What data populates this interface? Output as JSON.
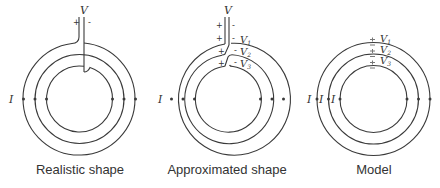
{
  "panels": [
    {
      "id": "realistic",
      "caption": "Realistic shape",
      "voltage_label": "V",
      "plus_sign": "+",
      "minus_sign": "-",
      "current_label": "I"
    },
    {
      "id": "approximated",
      "caption": "Approximated shape",
      "voltage_label": "V",
      "plus_signs": [
        "+",
        "+",
        "+",
        "+"
      ],
      "minus_signs": [
        "-",
        "-",
        "-",
        "-"
      ],
      "sub_voltages": [
        "V₁",
        "V₂",
        "V₃"
      ],
      "v_main": "V",
      "v1": "V",
      "v1_sub": "1",
      "v2": "V",
      "v2_sub": "2",
      "v3": "V",
      "v3_sub": "3",
      "current_label": "I"
    },
    {
      "id": "model",
      "caption": "Model",
      "v1": "V",
      "v1_sub": "1",
      "v2": "V",
      "v2_sub": "2",
      "v3": "V",
      "v3_sub": "3",
      "current_labels": [
        "I",
        "I",
        "I"
      ]
    }
  ],
  "colors": {
    "stroke": "#3a3a3a",
    "text": "#333333",
    "marker": "#777777"
  }
}
